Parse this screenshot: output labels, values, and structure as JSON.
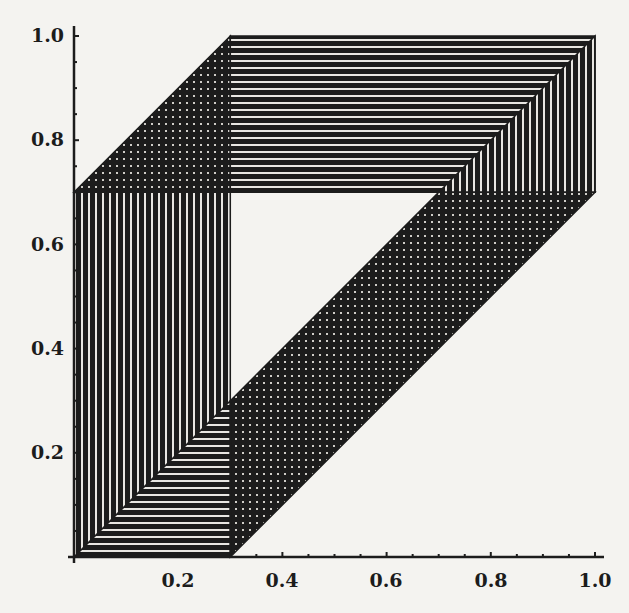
{
  "chart_data": {
    "type": "area",
    "title": "",
    "xlabel": "",
    "ylabel": "",
    "xlim": [
      0,
      1
    ],
    "ylim": [
      0,
      1
    ],
    "grid": false,
    "legend": null,
    "x_ticks": [
      "0.2",
      "0.4",
      "0.6",
      "0.8",
      "1.0"
    ],
    "y_ticks": [
      "0.2",
      "0.4",
      "0.6",
      "0.8",
      "1.0"
    ],
    "x_tick_values": [
      0.2,
      0.4,
      0.6,
      0.8,
      1.0
    ],
    "y_tick_values": [
      0.2,
      0.4,
      0.6,
      0.8,
      1.0
    ],
    "minor_tick_step": 0.05,
    "regions": [
      {
        "name": "left-vertical-block",
        "hatch": "vertical",
        "polygon": [
          [
            0,
            0
          ],
          [
            0.3,
            0
          ],
          [
            0.3,
            0.7
          ],
          [
            0,
            0.7
          ]
        ]
      },
      {
        "name": "bottom-horizontal-triangle",
        "hatch": "horizontal",
        "polygon": [
          [
            0,
            0
          ],
          [
            0.3,
            0
          ],
          [
            0.3,
            0.3
          ]
        ]
      },
      {
        "name": "top-left-crosshatch-wedge",
        "hatch": "cross",
        "polygon": [
          [
            0,
            0.7
          ],
          [
            0.3,
            0.7
          ],
          [
            0.3,
            1.0
          ]
        ]
      },
      {
        "name": "top-horizontal-band",
        "hatch": "horizontal",
        "polygon": [
          [
            0.3,
            0.7
          ],
          [
            1.0,
            0.7
          ],
          [
            1.0,
            1.0
          ],
          [
            0.3,
            1.0
          ]
        ]
      },
      {
        "name": "right-vertical-wedge",
        "hatch": "vertical",
        "polygon": [
          [
            0.7,
            0.7
          ],
          [
            1.0,
            1.0
          ],
          [
            1.0,
            0.7
          ]
        ]
      },
      {
        "name": "diagonal-crosshatch-band",
        "hatch": "cross",
        "polygon": [
          [
            0.3,
            0
          ],
          [
            0.3,
            0.3
          ],
          [
            0.7,
            0.7
          ],
          [
            1.0,
            0.7
          ]
        ]
      }
    ]
  },
  "axes": {
    "x_tick_labels": [
      "0.2",
      "0.4",
      "0.6",
      "0.8",
      "1.0"
    ],
    "y_tick_labels": [
      "0.2",
      "0.4",
      "0.6",
      "0.8",
      "1.0"
    ]
  },
  "colors": {
    "ink": "#1c1c1c",
    "paper": "#f4f3f0"
  }
}
